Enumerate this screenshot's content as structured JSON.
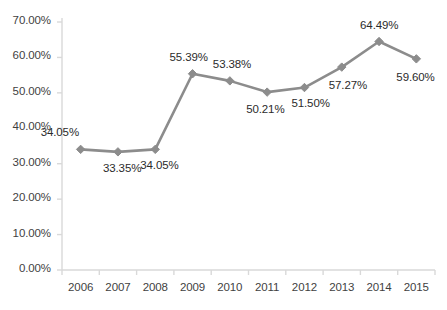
{
  "chart_data": {
    "type": "line",
    "title": "",
    "xlabel": "",
    "ylabel": "",
    "categories": [
      "2006",
      "2007",
      "2008",
      "2009",
      "2010",
      "2011",
      "2012",
      "2013",
      "2014",
      "2015"
    ],
    "values": [
      34.05,
      33.35,
      34.05,
      55.39,
      53.38,
      50.21,
      51.5,
      57.27,
      64.49,
      59.6
    ],
    "point_labels": [
      "34.05%",
      "33.35%",
      "34.05%",
      "55.39%",
      "53.38%",
      "50.21%",
      "51.50%",
      "57.27%",
      "64.49%",
      "59.60%"
    ],
    "ylim": [
      0,
      70
    ],
    "ytick_values": [
      0,
      10,
      20,
      30,
      40,
      50,
      60,
      70
    ],
    "ytick_labels": [
      "0.00%",
      "10.00%",
      "20.00%",
      "30.00%",
      "40.00%",
      "50.00%",
      "60.00%",
      "70.00%"
    ],
    "grid": false,
    "legend": "none",
    "series_color": "#8c8c8c",
    "marker": "diamond",
    "axis_color": "#d9d9d9",
    "text_color": "#3f3f3f",
    "background": "#ffffff"
  }
}
